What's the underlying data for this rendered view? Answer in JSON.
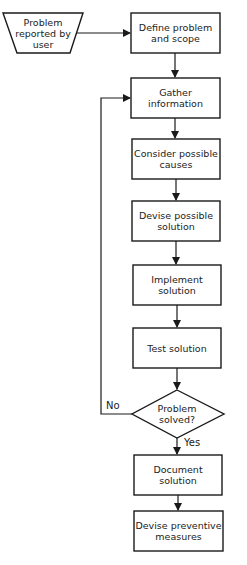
{
  "diagram": {
    "type": "flowchart",
    "nodes": [
      {
        "id": "reported",
        "shape": "trapezoid",
        "label": "Problem\nreported by\nuser"
      },
      {
        "id": "define",
        "shape": "rect",
        "label": "Define problem\nand scope"
      },
      {
        "id": "gather",
        "shape": "rect",
        "label": "Gather\ninformation"
      },
      {
        "id": "consider",
        "shape": "rect",
        "label": "Consider possible\ncauses"
      },
      {
        "id": "devise",
        "shape": "rect",
        "label": "Devise possible\nsolution"
      },
      {
        "id": "implement",
        "shape": "rect",
        "label": "Implement\nsolution"
      },
      {
        "id": "test",
        "shape": "rect",
        "label": "Test solution"
      },
      {
        "id": "solved",
        "shape": "diamond",
        "label": "Problem\nsolved?"
      },
      {
        "id": "document",
        "shape": "rect",
        "label": "Document\nsolution"
      },
      {
        "id": "prevent",
        "shape": "rect",
        "label": "Devise preventive\nmeasures"
      }
    ],
    "edges": [
      {
        "from": "reported",
        "to": "define",
        "label": ""
      },
      {
        "from": "define",
        "to": "gather",
        "label": ""
      },
      {
        "from": "gather",
        "to": "consider",
        "label": ""
      },
      {
        "from": "consider",
        "to": "devise",
        "label": ""
      },
      {
        "from": "devise",
        "to": "implement",
        "label": ""
      },
      {
        "from": "implement",
        "to": "test",
        "label": ""
      },
      {
        "from": "test",
        "to": "solved",
        "label": ""
      },
      {
        "from": "solved",
        "to": "gather",
        "label": "No"
      },
      {
        "from": "solved",
        "to": "document",
        "label": "Yes"
      },
      {
        "from": "document",
        "to": "prevent",
        "label": ""
      }
    ],
    "colors": {
      "stroke": "#1a1a1a",
      "fill": "#ffffff",
      "text": "#222222"
    }
  }
}
